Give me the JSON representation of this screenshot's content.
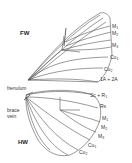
{
  "diagram": {
    "forewing": {
      "label": "FW",
      "veins": [
        {
          "base": "M",
          "sub": "1"
        },
        {
          "base": "M",
          "sub": "2"
        },
        {
          "base": "M",
          "sub": "3"
        },
        {
          "base": "Cu",
          "sub": "1"
        },
        {
          "base": "Cu",
          "sub": "2"
        },
        {
          "base": "1A + 2A",
          "sub": ""
        }
      ]
    },
    "hindwing": {
      "label": "HW",
      "structures": [
        "frenulum",
        "brace vein"
      ],
      "brace_label_lines": [
        "brace",
        "vein"
      ],
      "veins": [
        {
          "base": "Sc + R",
          "sub": "1"
        },
        {
          "base": "Rs",
          "sub": ""
        },
        {
          "base": "M",
          "sub": "1"
        },
        {
          "base": "M",
          "sub": "2"
        },
        {
          "base": "M",
          "sub": "3"
        },
        {
          "base": "Cu",
          "sub": "1"
        },
        {
          "base": "Cu",
          "sub": "2"
        }
      ]
    },
    "colors": {
      "line": "#555555",
      "text": "#333333",
      "background": "#ffffff"
    }
  }
}
